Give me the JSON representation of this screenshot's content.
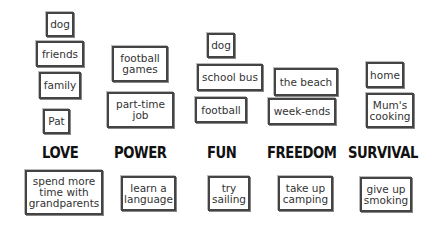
{
  "categories": [
    {
      "name": "LOVE",
      "items": [
        "dog",
        "friends",
        "family",
        "Pat"
      ],
      "activity": "spend more time with grandparents"
    },
    {
      "name": "POWER",
      "items": [
        "football games",
        "part-time job"
      ],
      "activity": "learn a language"
    },
    {
      "name": "FUN",
      "items": [
        "dog",
        "school bus",
        "football"
      ],
      "activity": "try sailing"
    },
    {
      "name": "FREEDOM",
      "items": [
        "the beach",
        "week-ends"
      ],
      "activity": "take up camping"
    },
    {
      "name": "SURVIVAL",
      "items": [
        "home",
        "Mum's cooking"
      ],
      "activity": "give up smoking"
    }
  ]
}
